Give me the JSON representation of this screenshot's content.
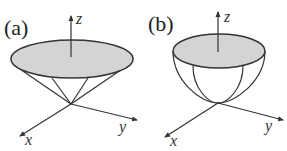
{
  "figure": {
    "panels": [
      {
        "id": "a",
        "label": "(a)",
        "shape": "cone",
        "axes": {
          "z": "z",
          "x": "x",
          "y": "y"
        }
      },
      {
        "id": "b",
        "label": "(b)",
        "shape": "paraboloid-bowl",
        "axes": {
          "z": "z",
          "x": "x",
          "y": "y"
        }
      }
    ],
    "colors": {
      "disk_fill": "#d4d4d4",
      "stroke": "#333333",
      "background": "#ffffff"
    }
  }
}
